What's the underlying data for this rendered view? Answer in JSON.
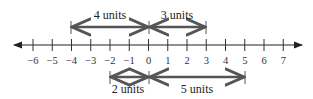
{
  "diagram": {
    "type": "number-line",
    "axis": {
      "min": -6,
      "max": 7,
      "tick_labels": [
        "−6",
        "−5",
        "−4",
        "−3",
        "−2",
        "−1",
        "0",
        "1",
        "2",
        "3",
        "4",
        "5",
        "6",
        "7"
      ]
    },
    "top_intervals": [
      {
        "from": -4,
        "to": 0,
        "label": "4 units"
      },
      {
        "from": 0,
        "to": 3,
        "label": "3 units"
      }
    ],
    "bottom_intervals": [
      {
        "from": -2,
        "to": 0,
        "label": "2 units"
      },
      {
        "from": 0,
        "to": 5,
        "label": "5 units"
      }
    ],
    "colors": {
      "axis": "#222222",
      "interval": "#555555"
    }
  }
}
